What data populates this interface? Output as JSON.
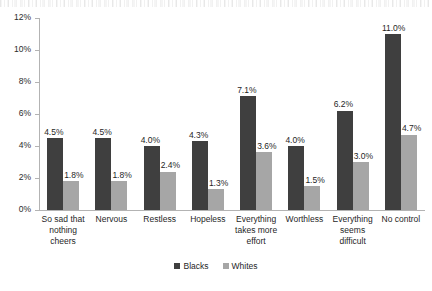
{
  "chart_data": {
    "type": "bar",
    "title": "",
    "subtitle": "",
    "xlabel": "",
    "ylabel": "",
    "ylim": [
      0,
      12
    ],
    "ytick_labels": [
      "12%",
      "10%",
      "8%",
      "6%",
      "4%",
      "2%",
      "0%"
    ],
    "ytick_values": [
      12,
      10,
      8,
      6,
      4,
      2,
      0
    ],
    "grid": false,
    "legend_position": "bottom",
    "categories": [
      "So sad that nothing cheers",
      "Nervous",
      "Restless",
      "Hopeless",
      "Everything takes more effort",
      "Worthless",
      "Everything seems difficult",
      "No control"
    ],
    "series": [
      {
        "name": "Blacks",
        "color": "#3f3f3f",
        "values": [
          4.5,
          4.5,
          4.0,
          4.3,
          7.1,
          4.0,
          6.2,
          11.0
        ],
        "labels": [
          "4.5%",
          "4.5%",
          "4.0%",
          "4.3%",
          "7.1%",
          "4.0%",
          "6.2%",
          "11.0%"
        ]
      },
      {
        "name": "Whites",
        "color": "#a6a6a6",
        "values": [
          1.8,
          1.8,
          2.4,
          1.3,
          3.6,
          1.5,
          3.0,
          4.7
        ],
        "labels": [
          "1.8%",
          "1.8%",
          "2.4%",
          "1.3%",
          "3.6%",
          "1.5%",
          "3.0%",
          "4.7%"
        ]
      }
    ]
  },
  "axis": {
    "y": {
      "ticks": [
        {
          "label": "12%"
        },
        {
          "label": "10%"
        },
        {
          "label": "8%"
        },
        {
          "label": "6%"
        },
        {
          "label": "4%"
        },
        {
          "label": "2%"
        },
        {
          "label": "0%"
        }
      ]
    },
    "x": {
      "categories": [
        {
          "lines": [
            "So sad that",
            "nothing",
            "cheers"
          ]
        },
        {
          "lines": [
            "Nervous"
          ]
        },
        {
          "lines": [
            "Restless"
          ]
        },
        {
          "lines": [
            "Hopeless"
          ]
        },
        {
          "lines": [
            "Everything",
            "takes more",
            "effort"
          ]
        },
        {
          "lines": [
            "Worthless"
          ]
        },
        {
          "lines": [
            "Everything",
            "seems",
            "difficult"
          ]
        },
        {
          "lines": [
            "No control"
          ]
        }
      ]
    }
  },
  "legend": {
    "items": [
      {
        "label": "Blacks",
        "color": "#3f3f3f"
      },
      {
        "label": "Whites",
        "color": "#a6a6a6"
      }
    ]
  }
}
